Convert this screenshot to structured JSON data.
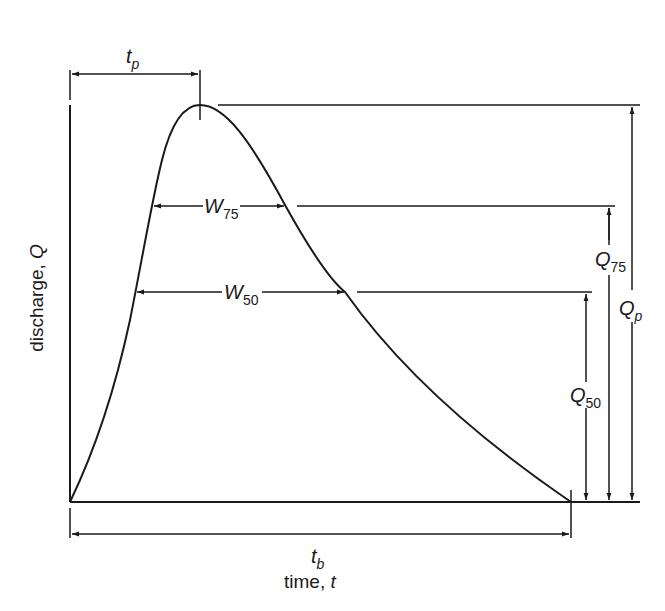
{
  "diagram": {
    "axes": {
      "x_label": "time, ",
      "x_label_var": "t",
      "y_label": "discharge, ",
      "y_label_var": "Q"
    },
    "labels": {
      "tp": {
        "main": "t",
        "sub": "p"
      },
      "tb": {
        "main": "t",
        "sub": "b"
      },
      "w75": {
        "main": "W",
        "sub": "75"
      },
      "w50": {
        "main": "W",
        "sub": "50"
      },
      "q75": {
        "main": "Q",
        "sub": "75"
      },
      "q50": {
        "main": "Q",
        "sub": "50"
      },
      "qp": {
        "main": "Q",
        "sub": "p"
      }
    },
    "colors": {
      "line": "#1a1a1a",
      "background": "#ffffff"
    }
  }
}
